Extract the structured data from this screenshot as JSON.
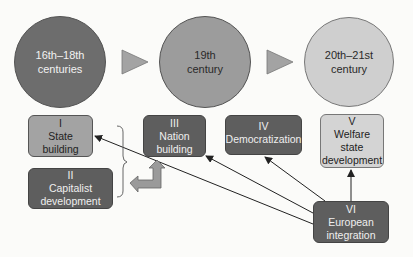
{
  "periods": [
    {
      "id": "p1",
      "line1": "16th–18th",
      "line2": "centuries",
      "shade": "dark"
    },
    {
      "id": "p2",
      "line1": "19th",
      "line2": "century",
      "shade": "mid"
    },
    {
      "id": "p3",
      "line1": "20th–21st",
      "line2": "century",
      "shade": "light"
    }
  ],
  "processes": [
    {
      "id": "I",
      "numeral": "I",
      "lines": [
        "State",
        "building"
      ],
      "shade": "mid"
    },
    {
      "id": "II",
      "numeral": "II",
      "lines": [
        "Capitalist",
        "development"
      ],
      "shade": "dark"
    },
    {
      "id": "III",
      "numeral": "III",
      "lines": [
        "Nation",
        "building"
      ],
      "shade": "dark"
    },
    {
      "id": "IV",
      "numeral": "IV",
      "lines": [
        "Democratization"
      ],
      "shade": "dark"
    },
    {
      "id": "V",
      "numeral": "V",
      "lines": [
        "Welfare",
        "state",
        "development"
      ],
      "shade": "light"
    },
    {
      "id": "VI",
      "numeral": "VI",
      "lines": [
        "European",
        "integration"
      ],
      "shade": "dark"
    }
  ],
  "connections": [
    {
      "from": "VI",
      "to": "I"
    },
    {
      "from": "VI",
      "to": "III"
    },
    {
      "from": "VI",
      "to": "IV"
    },
    {
      "from": "VI",
      "to": "V"
    },
    {
      "from": "I+II",
      "to": "III",
      "style": "bracket-block-arrow"
    }
  ],
  "colors": {
    "dark": "#5e5e5e",
    "mid": "#9c9c9c",
    "light": "#cfcfcf",
    "arrow": "#8c8c8c"
  }
}
